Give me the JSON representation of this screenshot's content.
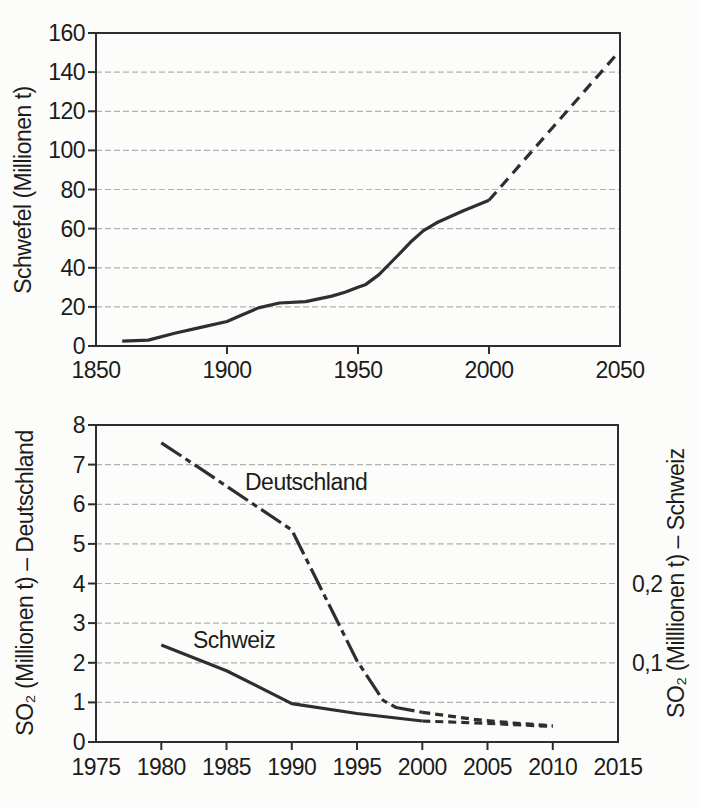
{
  "page": {
    "background": "#fcfcfa",
    "description_colors": {
      "line": "#2e2e2e",
      "grid": "#b0b0b0",
      "axis": "#2e2e2e",
      "text": "#1c1c1c"
    }
  },
  "chart_data": [
    {
      "type": "line",
      "ylabel": "Schwefel (Millionen t)",
      "xlabel": "",
      "xlim": [
        1850,
        2050
      ],
      "ylim": [
        0,
        160
      ],
      "x_ticks": [
        1850,
        1900,
        1950,
        2000,
        2050
      ],
      "y_ticks": [
        0,
        20,
        40,
        60,
        80,
        100,
        120,
        140,
        160
      ],
      "grid": "horizontal",
      "legend": "none",
      "series": [
        {
          "segments": [
            {
              "style": "solid",
              "points": [
                [
                  1860,
                  2.5
                ],
                [
                  1870,
                  3
                ],
                [
                  1880,
                  6.5
                ],
                [
                  1890,
                  9.5
                ],
                [
                  1900,
                  12.5
                ],
                [
                  1905,
                  15.5
                ],
                [
                  1912,
                  19.5
                ],
                [
                  1920,
                  22
                ],
                [
                  1930,
                  22.7
                ],
                [
                  1940,
                  25.5
                ],
                [
                  1945,
                  27.5
                ],
                [
                  1950,
                  30
                ],
                [
                  1953,
                  31.5
                ],
                [
                  1958,
                  36.5
                ],
                [
                  1965,
                  46
                ],
                [
                  1970,
                  53
                ],
                [
                  1975,
                  59
                ],
                [
                  1980,
                  63
                ],
                [
                  1990,
                  69
                ],
                [
                  2000,
                  74.5
                ]
              ]
            },
            {
              "style": "dashed",
              "points": [
                [
                  2000,
                  74.5
                ],
                [
                  2048,
                  148
                ]
              ]
            }
          ]
        }
      ]
    },
    {
      "type": "line",
      "ylabel_left": "SO₂ (Millionen t) – Deutschland",
      "ylabel_right": "SO₂ (Milllionen t) – Schweiz",
      "xlabel": "",
      "xlim": [
        1975,
        2015
      ],
      "ylim": [
        0,
        8
      ],
      "x_ticks": [
        1975,
        1980,
        1985,
        1990,
        1995,
        2000,
        2005,
        2010,
        2015
      ],
      "y_ticks": [
        0,
        1,
        2,
        3,
        4,
        5,
        6,
        7,
        8
      ],
      "y_ticks_right": [
        {
          "at": 4,
          "label": "0,2"
        },
        {
          "at": 2,
          "label": "0,1"
        }
      ],
      "grid": "horizontal",
      "legend": "in-plot-labels",
      "series": [
        {
          "name": "Deutschland",
          "segments": [
            {
              "style": "dashdot",
              "points": [
                [
                  1980,
                  7.55
                ],
                [
                  1983,
                  6.9
                ],
                [
                  1990,
                  5.35
                ],
                [
                  1995,
                  2.05
                ],
                [
                  1997,
                  1.05
                ],
                [
                  1998,
                  0.87
                ],
                [
                  2000,
                  0.75
                ]
              ]
            },
            {
              "style": "dashed_short",
              "points": [
                [
                  2000,
                  0.75
                ],
                [
                  2004,
                  0.57
                ],
                [
                  2007,
                  0.48
                ],
                [
                  2010,
                  0.41
                ]
              ]
            }
          ]
        },
        {
          "name": "Schweiz",
          "segments": [
            {
              "style": "solid",
              "points": [
                [
                  1980,
                  2.45
                ],
                [
                  1985,
                  1.8
                ],
                [
                  1990,
                  0.97
                ],
                [
                  1995,
                  0.72
                ],
                [
                  2000,
                  0.53
                ]
              ]
            },
            {
              "style": "dashed_short",
              "points": [
                [
                  2000,
                  0.53
                ],
                [
                  2005,
                  0.47
                ],
                [
                  2010,
                  0.39
                ]
              ]
            }
          ]
        }
      ]
    }
  ]
}
